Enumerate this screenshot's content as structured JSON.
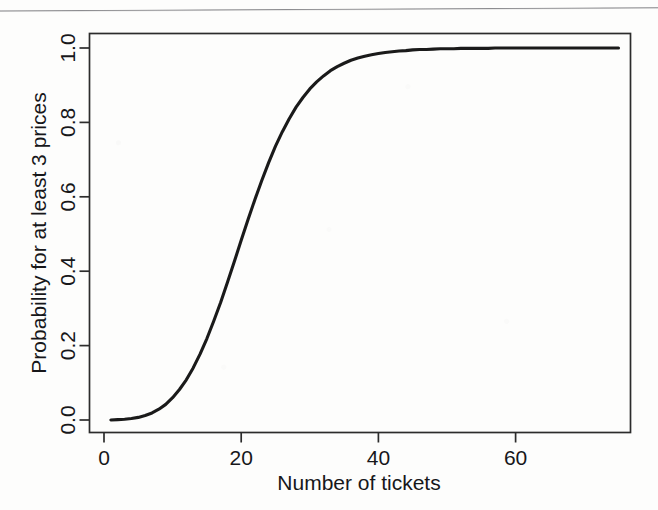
{
  "page": {
    "background_color": "#fdfdfc",
    "ink_color": "#1a1a1a",
    "scan_rule_color": "#787878"
  },
  "chart_data": {
    "type": "line",
    "title": "",
    "subtitle": "",
    "xlabel": "Number of tickets",
    "ylabel": "Probability for at least 3 prices",
    "xlim": [
      0,
      75
    ],
    "ylim": [
      0.0,
      1.02
    ],
    "xticks": [
      0,
      20,
      40,
      60
    ],
    "xtick_labels": [
      "0",
      "20",
      "40",
      "60"
    ],
    "yticks": [
      0.0,
      0.2,
      0.4,
      0.6,
      0.8,
      1.0
    ],
    "ytick_labels": [
      "0.0",
      "0.2",
      "0.4",
      "0.6",
      "0.8",
      "1.0"
    ],
    "grid": false,
    "legend": null,
    "legend_position": "none",
    "annotations": [],
    "series": [
      {
        "name": "Probability for at least 3 prices",
        "color": "#1a1a1a",
        "line_width": 3.1,
        "x": [
          1,
          2,
          3,
          4,
          5,
          6,
          7,
          8,
          9,
          10,
          11,
          12,
          13,
          14,
          15,
          16,
          17,
          18,
          19,
          20,
          21,
          22,
          23,
          24,
          25,
          26,
          27,
          28,
          29,
          30,
          31,
          32,
          33,
          34,
          35,
          36,
          37,
          38,
          39,
          40,
          41,
          42,
          43,
          44,
          45,
          46,
          47,
          48,
          49,
          50,
          51,
          52,
          53,
          54,
          55,
          56,
          57,
          58,
          59,
          60,
          61,
          62,
          63,
          64,
          65,
          66,
          67,
          68,
          69,
          70,
          71,
          72,
          73,
          74,
          75
        ],
        "y": [
          0.0,
          0.001,
          0.002,
          0.004,
          0.007,
          0.012,
          0.019,
          0.029,
          0.042,
          0.06,
          0.082,
          0.108,
          0.14,
          0.177,
          0.219,
          0.266,
          0.316,
          0.37,
          0.426,
          0.483,
          0.539,
          0.593,
          0.644,
          0.692,
          0.736,
          0.775,
          0.81,
          0.841,
          0.867,
          0.89,
          0.909,
          0.925,
          0.939,
          0.95,
          0.959,
          0.967,
          0.973,
          0.978,
          0.982,
          0.985,
          0.988,
          0.99,
          0.992,
          0.993,
          0.995,
          0.996,
          0.996,
          0.997,
          0.998,
          0.998,
          0.998,
          0.999,
          0.999,
          0.999,
          0.999,
          0.999,
          1.0,
          1.0,
          1.0,
          1.0,
          1.0,
          1.0,
          1.0,
          1.0,
          1.0,
          1.0,
          1.0,
          1.0,
          1.0,
          1.0,
          1.0,
          1.0,
          1.0,
          1.0,
          1.0
        ]
      }
    ]
  }
}
